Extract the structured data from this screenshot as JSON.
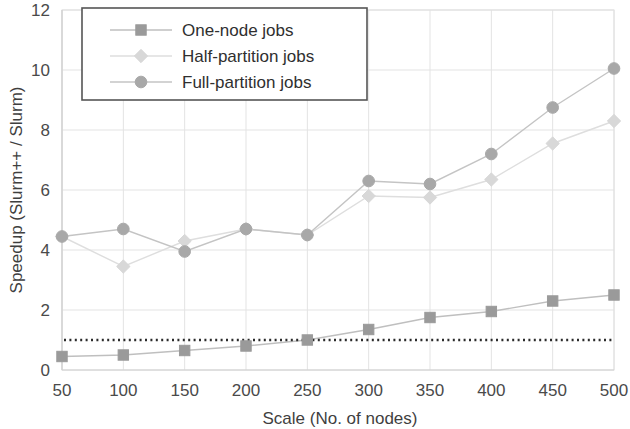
{
  "chart_data": {
    "type": "line",
    "title": "",
    "xlabel": "Scale (No. of nodes)",
    "ylabel": "Speedup (Slurm++ / Slurm)",
    "x": [
      50,
      100,
      150,
      200,
      250,
      300,
      350,
      400,
      450,
      500
    ],
    "categories": [
      "50",
      "100",
      "150",
      "200",
      "250",
      "300",
      "350",
      "400",
      "450",
      "500"
    ],
    "xlim": [
      50,
      500
    ],
    "ylim": [
      0,
      12
    ],
    "xticks": [
      50,
      100,
      150,
      200,
      250,
      300,
      350,
      400,
      450,
      500
    ],
    "yticks": [
      0,
      2,
      4,
      6,
      8,
      10,
      12
    ],
    "grid": true,
    "legend_position": "top-center",
    "series": [
      {
        "name": "One-node jobs",
        "marker": "square",
        "color": "#9a9a9a",
        "line_color": "#bfbfbf",
        "values": [
          0.45,
          0.5,
          0.65,
          0.8,
          1.0,
          1.35,
          1.75,
          1.95,
          2.3,
          2.5
        ]
      },
      {
        "name": "Half-partition jobs",
        "marker": "diamond",
        "color": "#d8d8d8",
        "line_color": "#dedede",
        "values": [
          4.45,
          3.45,
          4.3,
          4.7,
          4.5,
          5.8,
          5.75,
          6.35,
          7.55,
          8.3
        ]
      },
      {
        "name": "Full-partition jobs",
        "marker": "circle",
        "color": "#a8a8a8",
        "line_color": "#c4c4c4",
        "values": [
          4.45,
          4.7,
          3.95,
          4.7,
          4.5,
          6.3,
          6.2,
          7.2,
          8.75,
          10.05
        ]
      }
    ],
    "reference_line": {
      "name": "break-even",
      "value": 1.0,
      "style": "dotted",
      "color": "#2b2b2b"
    }
  },
  "axes": {
    "y_tick_labels": [
      "0",
      "2",
      "4",
      "6",
      "8",
      "10",
      "12"
    ],
    "x_tick_labels": [
      "50",
      "100",
      "150",
      "200",
      "250",
      "300",
      "350",
      "400",
      "450",
      "500"
    ],
    "y_axis_title": "Speedup (Slurm++ / Slurm)",
    "x_axis_title": "Scale (No. of nodes)"
  },
  "legend": {
    "entries": [
      {
        "label": "One-node jobs"
      },
      {
        "label": "Half-partition jobs"
      },
      {
        "label": "Full-partition jobs"
      }
    ]
  }
}
